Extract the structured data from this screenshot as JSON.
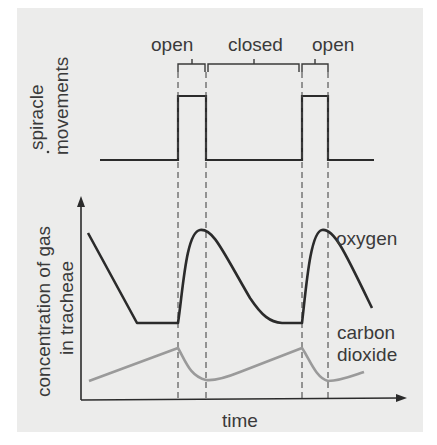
{
  "diagram": {
    "spiracle_panel": {
      "ylabel_line1": "spiracle",
      "ylabel_line2": "movements",
      "phases": [
        {
          "label": "open"
        },
        {
          "label": "closed"
        },
        {
          "label": "open"
        }
      ]
    },
    "gas_panel": {
      "ylabel_line1": "concentration of gas",
      "ylabel_line2": "in tracheae",
      "xlabel": "time",
      "series": [
        {
          "name": "oxygen",
          "label_line1": "oxygen",
          "color": "#2b2b2b"
        },
        {
          "name": "carbon dioxide",
          "label_line1": "carbon",
          "label_line2": "dioxide",
          "color": "#9a9a9a"
        }
      ]
    },
    "colors": {
      "background": "#ececeb",
      "line_dark": "#2b2b2b",
      "line_co2": "#9a9a9a",
      "text": "#3a3a3a"
    }
  }
}
